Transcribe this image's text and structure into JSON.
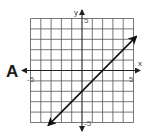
{
  "problem_label": "A",
  "chart_data": {
    "type": "line",
    "title": "",
    "xlabel": "x",
    "ylabel": "y",
    "xlim": [
      -5,
      5
    ],
    "ylim": [
      -5,
      5
    ],
    "grid": true,
    "tick_labels": {
      "x_min": "-5",
      "x_max": "5",
      "y_min": "-5",
      "y_max": "5"
    },
    "series": [
      {
        "name": "line",
        "equation": "y = x - 2",
        "slope": 1,
        "y_intercept": -2,
        "x": [
          -3.3,
          5.3
        ],
        "y": [
          -5.3,
          3.3
        ],
        "arrows_both_ends": true
      }
    ]
  },
  "colors": {
    "grid": "#555555",
    "axis": "#222222",
    "line": "#111111"
  }
}
